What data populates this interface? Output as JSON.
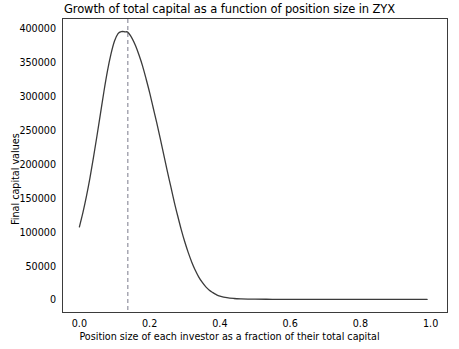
{
  "chart_data": {
    "type": "line",
    "title": "Growth of total capital as a function of position size in ZYX",
    "xlabel": "Position size of each investor as a fraction of their total capital",
    "ylabel": "Final capital values",
    "xlim": [
      -0.0495,
      1.0495
    ],
    "ylim": [
      -20000,
      415000
    ],
    "xticks": [
      0.0,
      0.2,
      0.4,
      0.6,
      0.8,
      1.0
    ],
    "xtick_labels": [
      "0.0",
      "0.2",
      "0.4",
      "0.6",
      "0.8",
      "1.0"
    ],
    "yticks": [
      0,
      50000,
      100000,
      150000,
      200000,
      250000,
      300000,
      350000,
      400000
    ],
    "ytick_labels": [
      "0",
      "50000",
      "100000",
      "150000",
      "200000",
      "250000",
      "300000",
      "350000",
      "400000"
    ],
    "grid": false,
    "legend": null,
    "line_color": "#3b3b3b",
    "annotation_color": "#7a7a8c",
    "series": [
      {
        "name": "Final capital values",
        "x": [
          0.0,
          0.01,
          0.02,
          0.03,
          0.04,
          0.05,
          0.06,
          0.07,
          0.08,
          0.09,
          0.1,
          0.11,
          0.12,
          0.13,
          0.138,
          0.15,
          0.16,
          0.17,
          0.18,
          0.19,
          0.2,
          0.21,
          0.22,
          0.23,
          0.24,
          0.25,
          0.26,
          0.27,
          0.28,
          0.29,
          0.3,
          0.31,
          0.32,
          0.33,
          0.34,
          0.35,
          0.36,
          0.37,
          0.38,
          0.39,
          0.4,
          0.42,
          0.44,
          0.46,
          0.48,
          0.5,
          0.55,
          0.6,
          0.65,
          0.7,
          0.75,
          0.8,
          0.85,
          0.9,
          0.95,
          0.99
        ],
        "y": [
          107000,
          128000,
          152000,
          179000,
          209000,
          241000,
          274000,
          307000,
          337000,
          362000,
          381000,
          392000,
          395000,
          394500,
          394000,
          385000,
          374000,
          360000,
          344000,
          325000,
          305000,
          283000,
          261000,
          238000,
          214000,
          190000,
          167000,
          144000,
          123000,
          103000,
          85000,
          69000,
          55000,
          43000,
          33000,
          25000,
          18500,
          13500,
          10000,
          7000,
          5000,
          2600,
          1400,
          800,
          500,
          350,
          200,
          150,
          120,
          100,
          90,
          80,
          70,
          60,
          55,
          50
        ]
      }
    ],
    "annotations": [
      {
        "type": "vline",
        "name": "optimal-position-size-line",
        "x": 0.138,
        "style": "dashed"
      }
    ]
  }
}
